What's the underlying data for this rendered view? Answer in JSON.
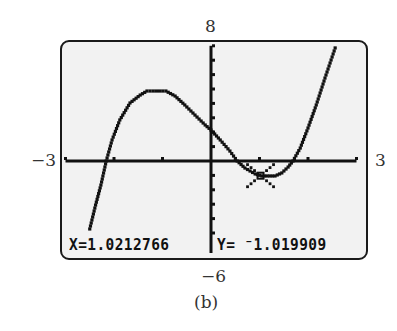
{
  "figure": {
    "caption": "(b)",
    "window_labels": {
      "xmin": "−3",
      "xmax": "3",
      "ymin": "−6",
      "ymax": "8"
    }
  },
  "readout": {
    "x_label": "X=1.0212766",
    "y_label": "Y= ⁻1.019909"
  },
  "colors": {
    "screen_background": "#f2f2f2",
    "plot_ink": "#111111",
    "frame": "#1a1a1a",
    "page_background": "#ffffff",
    "label_text": "#333333"
  },
  "chart_data": {
    "type": "line",
    "title": "",
    "caption": "(b)",
    "xlabel": "",
    "ylabel": "",
    "xlim": [
      -3,
      3
    ],
    "ylim": [
      -6,
      8
    ],
    "xscl": 1,
    "yscl": 1,
    "grid": false,
    "legend": null,
    "series": [
      {
        "name": "cubic",
        "x": [
          -2.5,
          -2.38,
          -2.27,
          -2.16,
          -2.04,
          -1.88,
          -1.67,
          -1.46,
          -1.32,
          -0.93,
          -0.74,
          -0.54,
          -0.33,
          -0.12,
          0.0,
          0.19,
          0.39,
          0.54,
          0.7,
          0.91,
          1.05,
          1.32,
          1.46,
          1.59,
          1.69,
          1.84,
          2.0,
          2.17,
          2.35,
          2.56
        ],
        "y": [
          -4.72,
          -3.06,
          -1.67,
          0.0,
          1.46,
          2.85,
          4.03,
          4.58,
          4.86,
          4.86,
          4.51,
          3.89,
          3.19,
          2.5,
          2.15,
          1.46,
          0.69,
          0.0,
          -0.49,
          -0.9,
          -1.04,
          -1.04,
          -0.83,
          -0.42,
          0.0,
          0.9,
          2.29,
          3.89,
          5.76,
          7.85
        ]
      }
    ],
    "cursor": {
      "x": 1.0212766,
      "y": -1.019909,
      "marker": "box-with-x"
    },
    "pixel_mapping": {
      "x_origin_px": 211,
      "y_origin_px": 161,
      "px_per_x_unit": 48.5,
      "px_per_y_unit": 14.4
    }
  }
}
